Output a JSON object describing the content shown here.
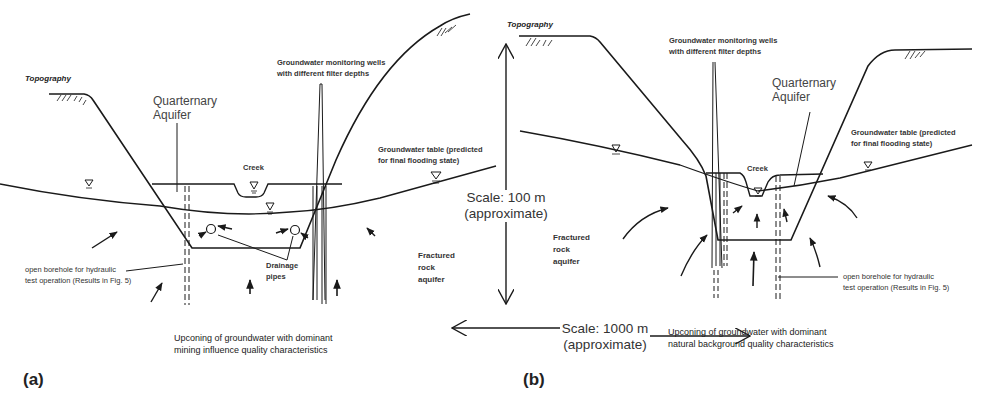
{
  "figure": {
    "panels": [
      {
        "id": "a",
        "label": "(a)",
        "topography": "Topography",
        "quaternary_aquifer": [
          "Quarternary",
          "Aquifer"
        ],
        "monitoring_wells": [
          "Groundwater monitoring wells",
          "with different filter depths"
        ],
        "creek": "Creek",
        "groundwater_table": [
          "Groundwater table (predicted",
          "for final flooding state)"
        ],
        "borehole": [
          "open borehole for hydraulic",
          "test operation (Results in Fig. 5)"
        ],
        "drainage": [
          "Drainage",
          "pipes"
        ],
        "fractured": [
          "Fractured",
          "rock",
          "aquifer"
        ],
        "upconing": [
          "Upconing of groundwater with dominant",
          "mining influence quality characteristics"
        ]
      },
      {
        "id": "b",
        "label": "(b)",
        "topography": "Topography",
        "quaternary_aquifer": [
          "Quarternary",
          "Aquifer"
        ],
        "monitoring_wells": [
          "Groundwater monitoring wells",
          "with different filter depths"
        ],
        "creek": "Creek",
        "groundwater_table": [
          "Groundwater table (predicted",
          "for final flooding state)"
        ],
        "borehole": [
          "open borehole for hydraulic",
          "test operation (Results in Fig. 5)"
        ],
        "fractured": [
          "Fractured",
          "rock",
          "aquifer"
        ],
        "upconing": [
          "Upconing of groundwater with dominant",
          "natural background quality characteristics"
        ]
      }
    ],
    "scale_vertical": [
      "Scale: 100 m",
      "(approximate)"
    ],
    "scale_horizontal": [
      "Scale: 1000 m",
      "(approximate)"
    ],
    "line_color": "#1a1a1a"
  }
}
